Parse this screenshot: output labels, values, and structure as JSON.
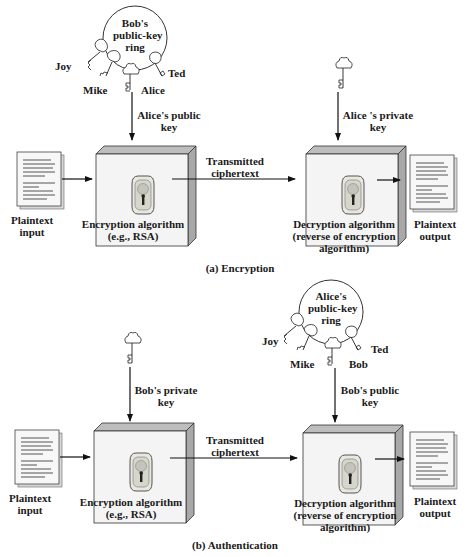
{
  "panels": [
    {
      "caption": "(a) Encryption",
      "key_ring": {
        "title_lines": [
          "Bob's",
          "public-key",
          "ring"
        ],
        "keys": [
          "Joy",
          "Mike",
          "Alice",
          "Ted"
        ]
      },
      "enc_key_label": [
        "Alice's public",
        "key"
      ],
      "dec_key_label": [
        "Alice 's private",
        "key"
      ],
      "input_label": [
        "Plaintext",
        "input"
      ],
      "enc_label": [
        "Encryption algorithm",
        "(e.g., RSA)"
      ],
      "channel_label": [
        "Transmitted",
        "ciphertext"
      ],
      "dec_label": [
        "Decryption algorithm",
        "(reverse of encryption",
        "algorithm)"
      ],
      "output_label": [
        "Plaintext",
        "output"
      ]
    },
    {
      "caption": "(b) Authentication",
      "key_ring": {
        "title_lines": [
          "Alice's",
          "public-key",
          "ring"
        ],
        "keys": [
          "Joy",
          "Mike",
          "Bob",
          "Ted"
        ]
      },
      "enc_key_label": [
        "Bob's private",
        "key"
      ],
      "dec_key_label": [
        "Bob's public",
        "key"
      ],
      "input_label": [
        "Plaintext",
        "input"
      ],
      "enc_label": [
        "Encryption algorithm",
        "(e.g., RSA)"
      ],
      "channel_label": [
        "Transmitted",
        "ciphertext"
      ],
      "dec_label": [
        "Decryption algorithm",
        "(reverse of encryption",
        "algorithm)"
      ],
      "output_label": [
        "Plaintext",
        "output"
      ]
    }
  ]
}
